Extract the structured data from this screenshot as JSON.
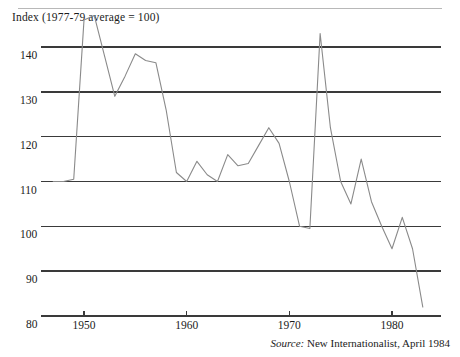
{
  "figure": {
    "title": "Index (1977-79 average  =  100)",
    "source_lead": "Source:",
    "source_text": "New Internationalist, April 1984"
  },
  "chart_data": {
    "type": "line",
    "title": "Index (1977-79 average  =  100)",
    "subtitle": "",
    "xlabel": "",
    "ylabel": "Index (1977-79 average = 100)",
    "xlim": [
      1947,
      1984
    ],
    "ylim": [
      80,
      147
    ],
    "yticks": [
      80,
      90,
      100,
      110,
      120,
      130,
      140
    ],
    "ytick_labels": [
      "80",
      "90",
      "100",
      "110",
      "120",
      "130",
      "140"
    ],
    "xticks": [
      1950,
      1960,
      1970,
      1980
    ],
    "xtick_labels": [
      "1950",
      "1960",
      "1970",
      "1980"
    ],
    "grid": "horizontal",
    "legend": "none",
    "line_color": "#8a8a8a",
    "axis_color": "#3a3a3a",
    "annotations": [],
    "series": [
      {
        "name": "Commodity price index",
        "x": [
          1947,
          1948,
          1949,
          1950,
          1951,
          1952,
          1953,
          1954,
          1955,
          1956,
          1957,
          1958,
          1959,
          1960,
          1961,
          1962,
          1963,
          1964,
          1965,
          1966,
          1967,
          1968,
          1969,
          1970,
          1971,
          1972,
          1973,
          1974,
          1975,
          1976,
          1977,
          1978,
          1979,
          1980,
          1981,
          1982,
          1983
        ],
        "values": [
          110.0,
          110.0,
          110.5,
          146.0,
          147.0,
          138.0,
          129.0,
          133.5,
          138.5,
          137.0,
          136.5,
          126.0,
          112.0,
          110.0,
          114.5,
          111.5,
          110.0,
          116.0,
          113.5,
          114.0,
          118.0,
          122.0,
          118.5,
          110.0,
          100.0,
          99.5,
          143.0,
          122.0,
          110.0,
          105.0,
          115.0,
          105.5,
          100.0,
          95.0,
          102.0,
          95.0,
          82.0
        ]
      }
    ]
  }
}
